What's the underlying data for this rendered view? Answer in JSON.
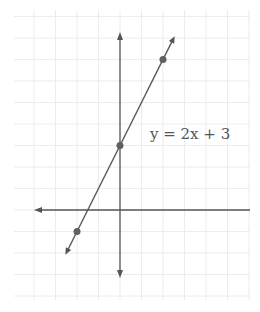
{
  "chart_data": {
    "type": "line",
    "title": "",
    "equation_label": "y = 2x + 3",
    "xlabel": "",
    "ylabel": "",
    "grid": true,
    "xlim": [
      -4,
      6
    ],
    "ylim": [
      -4,
      9
    ],
    "series": [
      {
        "name": "y = 2x + 3",
        "slope": 2,
        "intercept": 3,
        "x": [
          -2,
          0,
          2
        ],
        "y": [
          -1,
          3,
          7
        ],
        "marked_points": [
          [
            -2,
            -1
          ],
          [
            0,
            3
          ],
          [
            2,
            7
          ]
        ]
      }
    ]
  },
  "colors": {
    "grid": "#ececec",
    "axis": "#555555",
    "line": "#555555",
    "point": "#606060",
    "label": "#555555"
  }
}
